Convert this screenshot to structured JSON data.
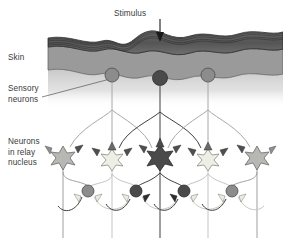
{
  "figure": {
    "background": "#ffffff"
  },
  "labels": {
    "stimulus": "Stimulus",
    "skin": "Skin",
    "sensory_neurons": "Sensory\nneurons",
    "relay_neurons": "Neurons\nin relay\nnucleus"
  },
  "colors": {
    "text": "#3a3a3a",
    "epidermis_dark": "#5d5d5d",
    "epidermis_line": "#2f2f2f",
    "dermis_mid": "#9a9a9a",
    "hypodermis_light": "#c9c9c9",
    "cell_dark": "#4a4a4a",
    "cell_mid": "#8c8c8c",
    "cell_light": "#d8d8d4",
    "cell_pale": "#efeee4",
    "axon_dark": "#3f3f3f",
    "axon_light": "#c4c4c4",
    "arrow": "#1a1a1a",
    "leader": "#555555"
  },
  "diagram": {
    "stimulus_arrow": {
      "x": 160,
      "y_top": 18,
      "y_tip": 41
    },
    "skin": {
      "epidermis_top_y": 38,
      "epidermis_bottom_y": 52,
      "dermis_bottom_y": 76,
      "x_start": 48,
      "x_end": 283,
      "striation_count": 5
    },
    "sensory_neurons": [
      {
        "id": "sensory-left",
        "x": 112,
        "y": 75,
        "r": 7.0,
        "fill": "#8c8c8c",
        "activation": "moderate"
      },
      {
        "id": "sensory-center",
        "x": 160,
        "y": 78,
        "r": 7.5,
        "fill": "#4a4a4a",
        "activation": "strong"
      },
      {
        "id": "sensory-right",
        "x": 208,
        "y": 75,
        "r": 7.0,
        "fill": "#8c8c8c",
        "activation": "moderate"
      }
    ],
    "relay_neurons": [
      {
        "id": "relay-1",
        "x": 63,
        "y": 156,
        "r": 9.0,
        "fill": "#b7b7b3",
        "activation": "weak"
      },
      {
        "id": "relay-2",
        "x": 112,
        "y": 158,
        "r": 8.5,
        "fill": "#efeee4",
        "activation": "inhibited"
      },
      {
        "id": "relay-3",
        "x": 160,
        "y": 156,
        "r": 9.5,
        "fill": "#4a4a4a",
        "activation": "strong"
      },
      {
        "id": "relay-4",
        "x": 208,
        "y": 158,
        "r": 8.5,
        "fill": "#efeee4",
        "activation": "inhibited"
      },
      {
        "id": "relay-5",
        "x": 257,
        "y": 156,
        "r": 9.0,
        "fill": "#b7b7b3",
        "activation": "weak"
      }
    ],
    "interneurons": [
      {
        "id": "inter-1",
        "x": 88,
        "y": 191,
        "r": 6.0,
        "fill": "#8c8c8c"
      },
      {
        "id": "inter-2",
        "x": 136,
        "y": 191,
        "r": 6.0,
        "fill": "#4a4a4a"
      },
      {
        "id": "inter-3",
        "x": 184,
        "y": 191,
        "r": 6.0,
        "fill": "#4a4a4a"
      },
      {
        "id": "inter-4",
        "x": 232,
        "y": 191,
        "r": 6.0,
        "fill": "#8c8c8c"
      }
    ],
    "output_axons_x": [
      63,
      112,
      160,
      208,
      257
    ],
    "output_axon_y_bottom": 238,
    "leader_line": {
      "x1": 44,
      "y1": 96,
      "x2": 112,
      "y2": 78
    }
  }
}
